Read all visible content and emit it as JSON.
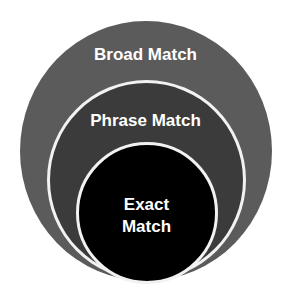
{
  "diagram": {
    "type": "nested-circles",
    "levels": [
      {
        "label": "Broad Match",
        "color": "#5b5b5b"
      },
      {
        "label": "Phrase Match",
        "color": "#3b3b3b"
      },
      {
        "label_line1": "Exact",
        "label_line2": "Match",
        "color": "#000000"
      }
    ],
    "ring_color": "#f2f2f2",
    "text_color": "#ffffff"
  }
}
